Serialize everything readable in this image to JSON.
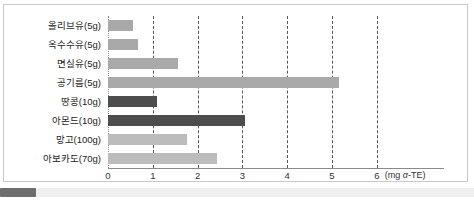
{
  "chart_data": {
    "type": "bar",
    "orientation": "horizontal",
    "title": "",
    "xlabel": "(mg α-TE)",
    "ylabel": "",
    "xlim": [
      0,
      6.5
    ],
    "xticks": [
      0,
      1,
      2,
      3,
      4,
      5,
      6
    ],
    "xticklabels": [
      "0",
      "1",
      "2",
      "3",
      "4",
      "5",
      "6"
    ],
    "grid": true,
    "grid_style": "dashed-vertical",
    "legend": false,
    "categories": [
      "올리브유(5g)",
      "옥수수유(5g)",
      "면실유(5g)",
      "공기름(5g)",
      "땅콩(10g)",
      "아몬드(10g)",
      "망고(100g)",
      "아보카도(70g)"
    ],
    "values": [
      0.56,
      0.67,
      1.56,
      5.15,
      1.09,
      3.06,
      1.76,
      2.43
    ],
    "bar_colors": [
      "#a9a9a9",
      "#a9a9a9",
      "#a9a9a9",
      "#a9a9a9",
      "#4d4d4d",
      "#4d4d4d",
      "#bcbcbc",
      "#bcbcbc"
    ]
  },
  "axis": {
    "unit_prefix": "(mg ",
    "unit_symbol": "α",
    "unit_suffix": "-TE)"
  },
  "colors": {
    "border": "#c9c9c9",
    "axis": "#8a8a8a",
    "grid": "#555555",
    "text": "#222222",
    "bar_medium": "#a9a9a9",
    "bar_dark": "#4d4d4d",
    "bar_light": "#bcbcbc",
    "scrollbar_track": "#efefef",
    "scrollbar_thumb": "#6e6e6e"
  }
}
